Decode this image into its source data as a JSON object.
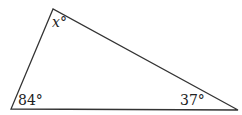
{
  "figure": {
    "type": "triangle",
    "vertices": {
      "top": {
        "x": 53,
        "y": 9
      },
      "bottom_left": {
        "x": 11,
        "y": 109
      },
      "bottom_right": {
        "x": 238,
        "y": 110
      }
    },
    "angles": {
      "top": "x°",
      "bottom_left": "84°",
      "bottom_right": "37°"
    },
    "stroke_color": "#333333"
  }
}
